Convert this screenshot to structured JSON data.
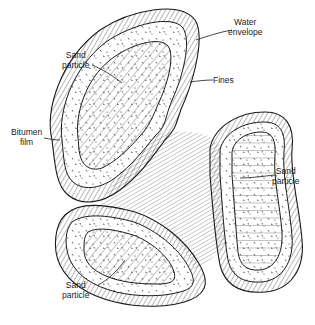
{
  "diagram": {
    "labels": {
      "water_envelope": {
        "line1": "Water",
        "line2": "envelope"
      },
      "fines": {
        "line1": "Fines"
      },
      "sand_particle_top": {
        "line1": "Sand",
        "line2": "particle"
      },
      "bitumen_film": {
        "line1": "Bitumen",
        "line2": "film"
      },
      "sand_particle_right": {
        "line1": "Sand",
        "line2": "particle"
      },
      "sand_particle_bottom": {
        "line1": "Sand",
        "line2": "particle"
      }
    },
    "colors": {
      "ink": "#1a1a1a",
      "background": "#ffffff"
    }
  }
}
